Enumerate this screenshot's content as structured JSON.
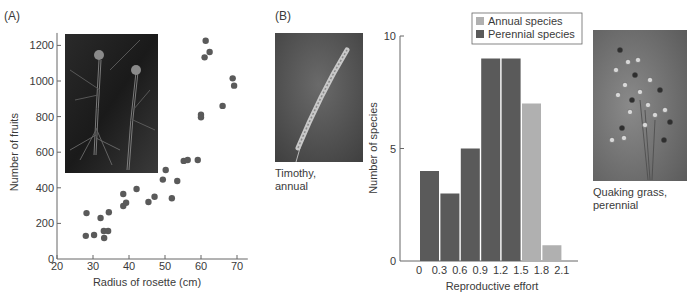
{
  "panels": {
    "a_label": "(A)",
    "b_label": "(B)"
  },
  "photos": {
    "rosette": {
      "description": "black-and-white photo of rosette plants with tall flower stalks"
    },
    "timothy": {
      "description": "photo of Timothy grass seed head",
      "caption_line1": "Timothy,",
      "caption_line2": "annual"
    },
    "quaking": {
      "description": "photo of Quaking grass",
      "caption_line1": "Quaking grass,",
      "caption_line2": "perennial"
    }
  },
  "colors": {
    "point": "#5a5a5a",
    "perennial": "#5a5a5a",
    "annual": "#b0b0b0",
    "axis": "#666666"
  },
  "chart_data": [
    {
      "type": "scatter",
      "title": "",
      "xlabel": "Radius of rosette (cm)",
      "ylabel": "Number of fruits",
      "xlim": [
        20,
        73
      ],
      "ylim": [
        0,
        1270
      ],
      "xticks": [
        20,
        30,
        40,
        50,
        60,
        70
      ],
      "yticks": [
        0,
        200,
        400,
        600,
        800,
        1000,
        1200
      ],
      "grid": false,
      "points": [
        {
          "x": 28.2,
          "y": 258
        },
        {
          "x": 28.0,
          "y": 130
        },
        {
          "x": 30.3,
          "y": 135
        },
        {
          "x": 32.1,
          "y": 230
        },
        {
          "x": 33.0,
          "y": 157
        },
        {
          "x": 34.2,
          "y": 157
        },
        {
          "x": 33.1,
          "y": 118
        },
        {
          "x": 34.4,
          "y": 263
        },
        {
          "x": 38.4,
          "y": 365
        },
        {
          "x": 38.4,
          "y": 298
        },
        {
          "x": 39.2,
          "y": 316
        },
        {
          "x": 42.1,
          "y": 393
        },
        {
          "x": 45.4,
          "y": 320
        },
        {
          "x": 47.1,
          "y": 350
        },
        {
          "x": 49.4,
          "y": 446
        },
        {
          "x": 50.2,
          "y": 500
        },
        {
          "x": 51.9,
          "y": 341
        },
        {
          "x": 53.4,
          "y": 438
        },
        {
          "x": 55.2,
          "y": 551
        },
        {
          "x": 56.3,
          "y": 556
        },
        {
          "x": 59.1,
          "y": 556
        },
        {
          "x": 60.0,
          "y": 811
        },
        {
          "x": 60.0,
          "y": 796
        },
        {
          "x": 61.3,
          "y": 1226
        },
        {
          "x": 61.0,
          "y": 1133
        },
        {
          "x": 62.4,
          "y": 1163
        },
        {
          "x": 66.0,
          "y": 860
        },
        {
          "x": 68.8,
          "y": 1015
        },
        {
          "x": 69.2,
          "y": 974
        }
      ]
    },
    {
      "type": "bar",
      "title": "",
      "xlabel": "Reproductive effort",
      "ylabel": "Number of species",
      "ylim": [
        0,
        10
      ],
      "yticks": [
        0,
        5,
        10
      ],
      "xtick_labels": [
        "0",
        "0.3",
        "0.6",
        "0.9",
        "1.2",
        "1.5",
        "1.8",
        "2.1"
      ],
      "grid": false,
      "legend": {
        "position": "top-right",
        "entries": [
          "Annual species",
          "Perennial species"
        ]
      },
      "bars": [
        {
          "bin": "0-0.3",
          "value": 4,
          "series": "Perennial species"
        },
        {
          "bin": "0.3-0.6",
          "value": 3,
          "series": "Perennial species"
        },
        {
          "bin": "0.6-0.9",
          "value": 5,
          "series": "Perennial species"
        },
        {
          "bin": "0.9-1.2",
          "value": 9,
          "series": "Perennial species"
        },
        {
          "bin": "1.2-1.5",
          "value": 9,
          "series": "Perennial species"
        },
        {
          "bin": "1.5-1.8",
          "value": 7,
          "series": "Annual species"
        },
        {
          "bin": "1.8-2.1",
          "value": 0.7,
          "series": "Annual species"
        }
      ]
    }
  ]
}
